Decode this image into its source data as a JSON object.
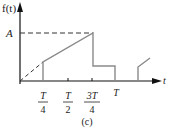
{
  "diagram": {
    "caption": "(c)",
    "y_axis_label": "f(t)",
    "x_axis_label": "t",
    "level_label": "A",
    "ticks": [
      {
        "num": "T",
        "den": "4"
      },
      {
        "num": "T",
        "den": "2"
      },
      {
        "num": "3T",
        "den": "4"
      },
      {
        "single": "T"
      }
    ],
    "colors": {
      "axis": "#111111",
      "signal": "#8a8a8a",
      "dashed": "#333333"
    }
  }
}
